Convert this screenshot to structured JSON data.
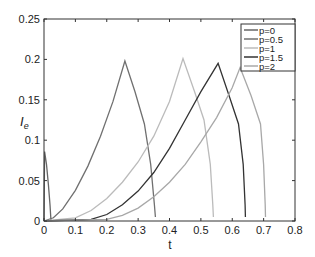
{
  "chart_data": {
    "type": "line",
    "title": "",
    "xlabel": "t",
    "ylabel": "I_e",
    "xlim": [
      0,
      0.8
    ],
    "ylim": [
      0,
      0.25
    ],
    "xticks": [
      "0",
      "0.1",
      "0.2",
      "0.3",
      "0.4",
      "0.5",
      "0.6",
      "0.7",
      "0.8"
    ],
    "yticks": [
      "0",
      "0.05",
      "0.1",
      "0.15",
      "0.2",
      "0.25"
    ],
    "grid": false,
    "legend_position": "upper right",
    "series": [
      {
        "name": "p=0",
        "color": "#666666",
        "points": [
          [
            0,
            0
          ],
          [
            0.002,
            0.086
          ],
          [
            0.008,
            0.07
          ],
          [
            0.014,
            0.045
          ],
          [
            0.019,
            0.02
          ],
          [
            0.022,
            0.002
          ],
          [
            0.024,
            0
          ]
        ]
      },
      {
        "name": "p=0.5",
        "color": "#707070",
        "points": [
          [
            0,
            0
          ],
          [
            0.03,
            0.004
          ],
          [
            0.06,
            0.015
          ],
          [
            0.1,
            0.038
          ],
          [
            0.14,
            0.068
          ],
          [
            0.18,
            0.105
          ],
          [
            0.22,
            0.148
          ],
          [
            0.258,
            0.198
          ],
          [
            0.29,
            0.16
          ],
          [
            0.32,
            0.12
          ],
          [
            0.34,
            0.07
          ],
          [
            0.352,
            0.02
          ],
          [
            0.355,
            0.005
          ]
        ]
      },
      {
        "name": "p=1",
        "color": "#bbbbbb",
        "points": [
          [
            0,
            0
          ],
          [
            0.1,
            0.004
          ],
          [
            0.15,
            0.013
          ],
          [
            0.2,
            0.028
          ],
          [
            0.25,
            0.048
          ],
          [
            0.3,
            0.073
          ],
          [
            0.35,
            0.105
          ],
          [
            0.4,
            0.148
          ],
          [
            0.443,
            0.201
          ],
          [
            0.48,
            0.16
          ],
          [
            0.51,
            0.125
          ],
          [
            0.53,
            0.07
          ],
          [
            0.538,
            0.02
          ],
          [
            0.54,
            0.005
          ]
        ]
      },
      {
        "name": "p=1.5",
        "color": "#333333",
        "points": [
          [
            0,
            0
          ],
          [
            0.15,
            0.002
          ],
          [
            0.2,
            0.008
          ],
          [
            0.25,
            0.02
          ],
          [
            0.3,
            0.037
          ],
          [
            0.35,
            0.06
          ],
          [
            0.4,
            0.09
          ],
          [
            0.45,
            0.125
          ],
          [
            0.5,
            0.16
          ],
          [
            0.555,
            0.195
          ],
          [
            0.59,
            0.155
          ],
          [
            0.62,
            0.12
          ],
          [
            0.635,
            0.07
          ],
          [
            0.641,
            0.02
          ],
          [
            0.642,
            0.005
          ]
        ]
      },
      {
        "name": "p=2",
        "color": "#a8a8a8",
        "points": [
          [
            0,
            0
          ],
          [
            0.2,
            0.002
          ],
          [
            0.25,
            0.007
          ],
          [
            0.3,
            0.016
          ],
          [
            0.35,
            0.03
          ],
          [
            0.4,
            0.048
          ],
          [
            0.45,
            0.07
          ],
          [
            0.5,
            0.098
          ],
          [
            0.55,
            0.128
          ],
          [
            0.6,
            0.165
          ],
          [
            0.625,
            0.19
          ],
          [
            0.66,
            0.155
          ],
          [
            0.69,
            0.12
          ],
          [
            0.7,
            0.07
          ],
          [
            0.705,
            0.02
          ],
          [
            0.706,
            0.005
          ]
        ]
      }
    ]
  }
}
